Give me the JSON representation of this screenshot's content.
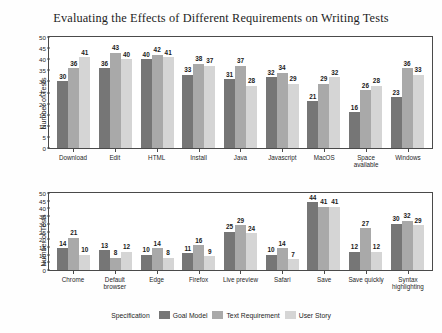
{
  "figure": {
    "title": "Evaluating the Effects of Different Requirements on Writing Tests",
    "legend_title": "Specification"
  },
  "colors": {
    "series_goal_model": "#767676",
    "series_text_requirement": "#a9a9a9",
    "series_user_story": "#d5d5d5",
    "frame": "#4a4a4a",
    "background": "#ffffff",
    "text": "#1f1f1f"
  },
  "chart_data": [
    {
      "type": "bar",
      "title": "Evaluating the Effects of Different Requirements on Writing Tests",
      "panel": "top",
      "xlabel": "",
      "ylabel": "Number of Tests",
      "ylim": [
        0,
        50
      ],
      "yticks": [
        0,
        5,
        10,
        15,
        20,
        25,
        30,
        35,
        40,
        45,
        50
      ],
      "grid": false,
      "legend_position": "bottom",
      "categories": [
        "Download",
        "Edit",
        "HTML",
        "Install",
        "Java",
        "Javascript",
        "MacOS",
        "Space available",
        "Windows"
      ],
      "series": [
        {
          "name": "Goal Model",
          "values": [
            30,
            36,
            40,
            33,
            31,
            32,
            21,
            16,
            23
          ]
        },
        {
          "name": "Text Requirement",
          "values": [
            36,
            43,
            42,
            38,
            37,
            34,
            29,
            26,
            36
          ]
        },
        {
          "name": "User Story",
          "values": [
            41,
            40,
            41,
            37,
            28,
            29,
            32,
            28,
            33
          ]
        }
      ]
    },
    {
      "type": "bar",
      "panel": "bottom",
      "xlabel": "",
      "ylabel": "Number of Tests",
      "ylim": [
        0,
        50
      ],
      "yticks": [
        0,
        5,
        10,
        15,
        20,
        25,
        30,
        35,
        40,
        45,
        50
      ],
      "grid": false,
      "legend_position": "bottom",
      "categories": [
        "Chrome",
        "Default browser",
        "Edge",
        "Firefox",
        "Live preview",
        "Safari",
        "Save",
        "Save quickly",
        "Syntax highlighting"
      ],
      "series": [
        {
          "name": "Goal Model",
          "values": [
            14,
            13,
            10,
            11,
            25,
            10,
            44,
            12,
            30
          ]
        },
        {
          "name": "Text Requirement",
          "values": [
            21,
            8,
            14,
            16,
            29,
            14,
            41,
            27,
            32
          ]
        },
        {
          "name": "User Story",
          "values": [
            10,
            12,
            8,
            9,
            24,
            7,
            41,
            12,
            29
          ]
        }
      ]
    }
  ],
  "legend": {
    "title": "Specification",
    "items": [
      {
        "label": "Goal Model"
      },
      {
        "label": "Text Requirement"
      },
      {
        "label": "User Story"
      }
    ]
  }
}
